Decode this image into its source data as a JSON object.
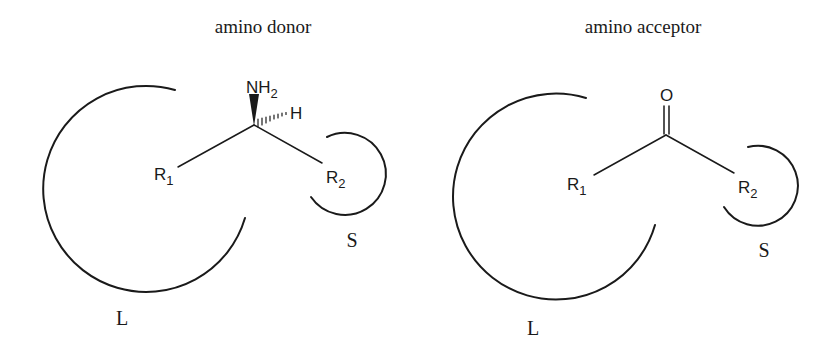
{
  "panels": [
    {
      "title": "amino donor",
      "atoms": {
        "nh": "NH",
        "nh_sub": "2",
        "h": "H",
        "r1": "R",
        "r1_sub": "1",
        "r2": "R",
        "r2_sub": "2"
      },
      "pocket_large": "L",
      "pocket_small": "S"
    },
    {
      "title": "amino acceptor",
      "atoms": {
        "o": "O",
        "r1": "R",
        "r1_sub": "1",
        "r2": "R",
        "r2_sub": "2"
      },
      "pocket_large": "L",
      "pocket_small": "S"
    }
  ],
  "colors": {
    "ink": "#1a1a1a",
    "background": "#ffffff"
  }
}
